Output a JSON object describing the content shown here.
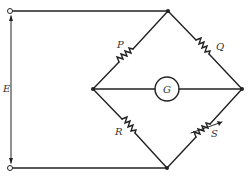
{
  "diagram": {
    "labels": {
      "P": "P",
      "Q": "Q",
      "R": "R",
      "S": "S",
      "G": "G",
      "E": "E"
    },
    "components": [
      {
        "id": "P",
        "type": "resistor",
        "branch": "left-top"
      },
      {
        "id": "Q",
        "type": "resistor",
        "branch": "top-right"
      },
      {
        "id": "R",
        "type": "resistor",
        "branch": "left-bottom"
      },
      {
        "id": "S",
        "type": "variable-resistor",
        "branch": "bottom-right"
      },
      {
        "id": "G",
        "type": "galvanometer",
        "branch": "left-right"
      },
      {
        "id": "E",
        "type": "voltage",
        "between": "top-terminal and bottom-terminal"
      }
    ],
    "colors": {
      "line": "#222222",
      "background": "#ffffff"
    }
  }
}
